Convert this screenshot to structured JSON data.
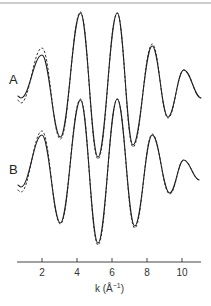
{
  "chart_data": {
    "type": "line",
    "title": "",
    "xlabel": "k (Å⁻¹)",
    "xlabel_parts": {
      "k": "k (Å",
      "sup": "−1",
      "close": ")"
    },
    "ylabel": "",
    "xlim": [
      0.6,
      11.1
    ],
    "x_ticks": [
      2,
      4,
      6,
      8,
      10
    ],
    "x_tick_labels": [
      "2",
      "4",
      "6",
      "8",
      "10"
    ],
    "grid": false,
    "legend": "none; panels labelled A and B, solid = fit, dashed = experiment",
    "panels": [
      {
        "label": "A",
        "offset_px": 85,
        "series": [
          {
            "name": "A solid",
            "style": "solid",
            "k": [
              0.6,
              0.8,
              2.0,
              3.05,
              4.2,
              5.2,
              6.3,
              7.2,
              8.3,
              9.2,
              10.1,
              11.1
            ],
            "values": [
              -1.1,
              -1.3,
              3.0,
              -5.2,
              7.2,
              -7.2,
              7.2,
              -6.0,
              3.9,
              -3.2,
              1.5,
              -1.3
            ]
          },
          {
            "name": "A dashed",
            "style": "dashed",
            "k": [
              0.6,
              0.8,
              2.0,
              3.05,
              4.2,
              5.2,
              6.3,
              7.2,
              8.3,
              9.2,
              10.1,
              11.1
            ],
            "values": [
              -1.5,
              -1.8,
              3.7,
              -5.4,
              7.3,
              -7.4,
              7.2,
              -6.2,
              4.1,
              -3.3,
              1.5,
              -1.3
            ]
          }
        ]
      },
      {
        "label": "B",
        "offset_px": 170,
        "series": [
          {
            "name": "B solid",
            "style": "solid",
            "k": [
              0.6,
              0.8,
              2.0,
              3.05,
              4.2,
              5.2,
              6.3,
              7.3,
              8.3,
              9.3,
              10.1,
              11.0
            ],
            "values": [
              -1.5,
              -1.7,
              3.5,
              -5.3,
              7.0,
              -7.3,
              7.1,
              -5.6,
              3.5,
              -2.3,
              1.0,
              -1.0
            ]
          },
          {
            "name": "B dashed",
            "style": "dashed",
            "k": [
              0.6,
              0.8,
              2.0,
              3.05,
              4.2,
              5.2,
              6.3,
              7.3,
              8.3,
              9.3,
              10.1,
              11.0
            ],
            "values": [
              -2.0,
              -2.2,
              3.9,
              -5.4,
              7.1,
              -7.5,
              7.1,
              -5.8,
              3.6,
              -2.4,
              1.0,
              -1.0
            ]
          }
        ]
      }
    ]
  },
  "colors": {
    "line": "#222222",
    "axis": "#444444",
    "frame_top": "#999999",
    "background": "#ffffff"
  }
}
